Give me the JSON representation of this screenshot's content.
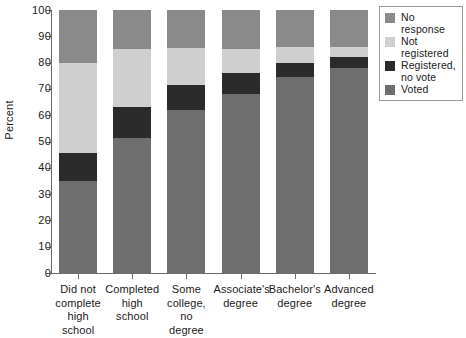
{
  "chart_data": {
    "type": "bar",
    "subtype": "stacked-bar-100",
    "title": "",
    "xlabel": "",
    "ylabel": "Percent",
    "ylim": [
      0,
      100
    ],
    "yticks": [
      0,
      10,
      20,
      30,
      40,
      50,
      60,
      70,
      80,
      90,
      100
    ],
    "ytick_labels": [
      "0",
      "10",
      "20",
      "30",
      "40",
      "50",
      "60",
      "70",
      "80",
      "90",
      "100"
    ],
    "grid": false,
    "legend_position": "right-top",
    "categories": [
      "Did not complete high school",
      "Completed high school",
      "Some college, no degree",
      "Associate's degree",
      "Bachelor's degree",
      "Advanced degree"
    ],
    "category_label_lines": [
      [
        "Did not",
        "complete",
        "high",
        "school"
      ],
      [
        "Completed",
        "high school"
      ],
      [
        "Some",
        "college,",
        "no",
        "degree"
      ],
      [
        "Associate's",
        "degree"
      ],
      [
        "Bachelor's",
        "degree"
      ],
      [
        "Advanced",
        "degree"
      ]
    ],
    "series": [
      {
        "name": "Voted",
        "color": "#6e6e6e",
        "values": [
          35.0,
          51.5,
          62.0,
          68.0,
          74.5,
          78.0
        ]
      },
      {
        "name": "Registered, no vote",
        "color": "#2b2b2b",
        "values": [
          10.5,
          11.5,
          9.5,
          8.0,
          5.5,
          4.0
        ]
      },
      {
        "name": "Not registered",
        "color": "#cfcfcf",
        "values": [
          34.5,
          22.0,
          14.0,
          9.0,
          6.0,
          4.0
        ]
      },
      {
        "name": "No response",
        "color": "#8a8a8a",
        "values": [
          20.0,
          15.0,
          14.5,
          15.0,
          14.0,
          14.0
        ]
      }
    ],
    "stack_order_bottom_to_top": [
      "Voted",
      "Registered, no vote",
      "Not registered",
      "No response"
    ]
  },
  "legend": {
    "entries": [
      {
        "label_line1": "No",
        "label_line2": "response",
        "color": "#8a8a8a"
      },
      {
        "label_line1": "Not",
        "label_line2": "registered",
        "color": "#cfcfcf"
      },
      {
        "label_line1": "Registered,",
        "label_line2": "no vote",
        "color": "#2b2b2b"
      },
      {
        "label_line1": "Voted",
        "label_line2": "",
        "color": "#6e6e6e"
      }
    ]
  },
  "axis": {
    "y_title": "Percent"
  }
}
